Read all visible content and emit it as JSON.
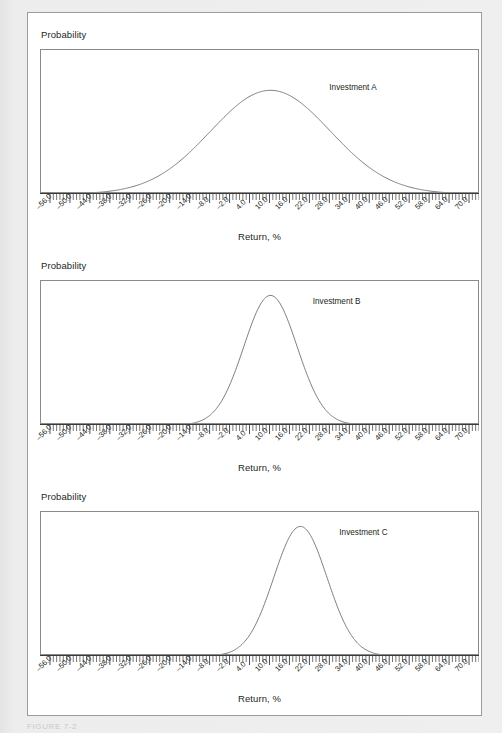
{
  "page": {
    "background_color": "#e9e9e9",
    "card_background_color": "#ffffff",
    "card_border_color": "#9b9b9b",
    "caption": "FIGURE 7-2"
  },
  "axis": {
    "ylabel": "Probability",
    "xlabel": "Return, %",
    "tick_labels": [
      "–56.0",
      "–50.0",
      "–44.0",
      "–38.0",
      "–32.0",
      "–26.0",
      "–20.0",
      "–14.0",
      "–8.0",
      "–2.0",
      "4.0",
      "10.0",
      "16.0",
      "22.0",
      "28.0",
      "34.0",
      "40.0",
      "46.0",
      "52.0",
      "58.0",
      "64.0",
      "70.0"
    ],
    "tick_values": [
      -56,
      -50,
      -44,
      -38,
      -32,
      -26,
      -20,
      -14,
      -8,
      -2,
      4,
      10,
      16,
      22,
      28,
      34,
      40,
      46,
      52,
      58,
      64,
      70
    ],
    "minor_ticks_per_major": 6,
    "curve_color": "#6f6f6f",
    "frame_color": "#8a8a8a",
    "text_color": "#231f20"
  },
  "chart_data": [
    {
      "type": "line",
      "title": "",
      "xlabel": "Return, %",
      "ylabel": "Probability",
      "xlim": [
        -59,
        73
      ],
      "ylim": [
        0,
        1
      ],
      "grid": false,
      "legend_position": "inline-right-of-peak",
      "series": [
        {
          "name": "Investment A",
          "distribution": "normal",
          "mean": 10.0,
          "std_dev": 18.0,
          "peak_height": 0.72,
          "label_x": 28.0,
          "label_y": 0.72
        }
      ]
    },
    {
      "type": "line",
      "title": "",
      "xlabel": "Return, %",
      "ylabel": "Probability",
      "xlim": [
        -59,
        73
      ],
      "ylim": [
        0,
        1
      ],
      "grid": false,
      "legend_position": "inline-right-of-peak",
      "series": [
        {
          "name": "Investment B",
          "distribution": "normal",
          "mean": 10.0,
          "std_dev": 8.0,
          "peak_height": 0.9,
          "label_x": 23.0,
          "label_y": 0.84
        }
      ]
    },
    {
      "type": "line",
      "title": "",
      "xlabel": "Return, %",
      "ylabel": "Probability",
      "xlim": [
        -59,
        73
      ],
      "ylim": [
        0,
        1
      ],
      "grid": false,
      "legend_position": "inline-right-of-peak",
      "series": [
        {
          "name": "Investment C",
          "distribution": "normal",
          "mean": 19.0,
          "std_dev": 8.0,
          "peak_height": 0.9,
          "label_x": 31.0,
          "label_y": 0.84
        }
      ]
    }
  ]
}
